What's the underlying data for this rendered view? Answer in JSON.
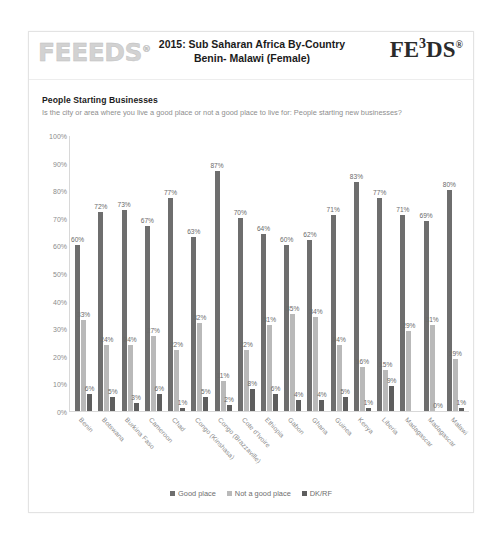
{
  "header": {
    "logo_left": "FEEEDS",
    "logo_left_reg": "®",
    "title_line1": "2015: Sub Saharan Africa By-Country",
    "title_line2": "Benin- Malawi (Female)",
    "logo_right_a": "FE",
    "logo_right_sup": "3",
    "logo_right_b": "DS",
    "logo_right_reg": "®"
  },
  "question": {
    "title": "People Starting Businesses",
    "text": "Is the city or area where you live a good place or not a good place to live for: People starting new businesses?"
  },
  "chart_data": {
    "type": "bar",
    "title": "People Starting Businesses",
    "xlabel": "",
    "ylabel": "",
    "ylim": [
      0,
      100
    ],
    "yticks": [
      "0%",
      "10%",
      "20%",
      "30%",
      "40%",
      "50%",
      "60%",
      "70%",
      "80%",
      "90%",
      "100%"
    ],
    "grid": false,
    "legend_position": "bottom",
    "categories": [
      "Benin",
      "Botswana",
      "Burkina Faso",
      "Cameroon",
      "Chad",
      "Congo (Kinshasa)",
      "Congo (Brazzaville)",
      "Cote d'Ivoire",
      "Ethiopia",
      "Gabon",
      "Ghana",
      "Guinea",
      "Kenya",
      "Liberia",
      "Madagascar",
      "Madagascar",
      "Malawi"
    ],
    "series": [
      {
        "name": "Good place",
        "color": "#6e6e6e",
        "values": [
          60,
          72,
          73,
          67,
          77,
          63,
          87,
          70,
          64,
          60,
          62,
          71,
          83,
          77,
          71,
          69,
          80
        ],
        "labels": [
          "60%",
          "72%",
          "73%",
          "67%",
          "77%",
          "63%",
          "87%",
          "70%",
          "64%",
          "60%",
          "62%",
          "71%",
          "83%",
          "77%",
          "71%",
          "69%",
          "80%"
        ]
      },
      {
        "name": "Not a good place",
        "color": "#b9b9b9",
        "values": [
          33,
          24,
          24,
          27,
          22,
          32,
          11,
          22,
          31,
          35,
          34,
          24,
          16,
          15,
          29,
          31,
          19
        ],
        "labels": [
          "33%",
          "24%",
          "24%",
          "27%",
          "22%",
          "32%",
          "11%",
          "22%",
          "31%",
          "35%",
          "34%",
          "24%",
          "16%",
          "15%",
          "29%",
          "31%",
          "19%"
        ]
      },
      {
        "name": "DK/RF",
        "color": "#5e5e5e",
        "values": [
          6,
          5,
          3,
          6,
          1,
          5,
          2,
          8,
          6,
          4,
          4,
          5,
          1,
          9,
          0,
          0,
          1
        ],
        "labels": [
          "6%",
          "5%",
          "3%",
          "6%",
          "1%",
          "5%",
          "2%",
          "8%",
          "6%",
          "4%",
          "4%",
          "5%",
          "1%",
          "9%",
          "",
          "0%",
          "1%"
        ]
      }
    ]
  },
  "legend": [
    {
      "label": "Good place",
      "color": "#6e6e6e"
    },
    {
      "label": "Not a good place",
      "color": "#b9b9b9"
    },
    {
      "label": "DK/RF",
      "color": "#5e5e5e"
    }
  ]
}
